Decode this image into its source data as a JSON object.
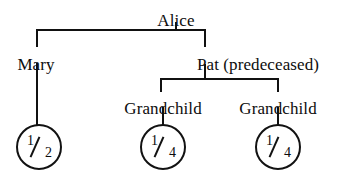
{
  "diagram": {
    "type": "family-tree-inheritance",
    "title": "",
    "background_color": "#ffffff",
    "line_color": "#111111",
    "text_color": "#0d0d0d"
  },
  "nodes": {
    "root": {
      "label": "Alice",
      "x": 176,
      "y": 12
    },
    "child_left": {
      "label": "Mary",
      "x": 36,
      "y": 56
    },
    "child_right": {
      "label": "Pat (predeceased)",
      "x": 258,
      "y": 56
    },
    "grandchild_left": {
      "label": "Grandchild",
      "x": 163,
      "y": 100
    },
    "grandchild_right": {
      "label": "Grandchild",
      "x": 278,
      "y": 100
    }
  },
  "shares": [
    {
      "name": "share-mary",
      "numerator": "1",
      "denominator": "2",
      "text": "1/2",
      "cx": 39,
      "cy": 147,
      "r": 21
    },
    {
      "name": "share-grandchild-left",
      "numerator": "1",
      "denominator": "4",
      "text": "1/4",
      "cx": 163,
      "cy": 147,
      "r": 21
    },
    {
      "name": "share-grandchild-right",
      "numerator": "1",
      "denominator": "4",
      "text": "1/4",
      "cx": 278,
      "cy": 147,
      "r": 21
    }
  ],
  "connectors": {
    "alice_stem": {
      "x": 176,
      "y_top": 22,
      "y_bottom": 30
    },
    "alice_bar": {
      "x_left": 37,
      "x_right": 206,
      "y": 29
    },
    "mary_drop_upper": {
      "x": 37,
      "y_top": 29,
      "y_bottom": 47
    },
    "mary_drop_lower": {
      "x": 37,
      "y_top": 63,
      "y_bottom": 125
    },
    "pat_drop_upper": {
      "x": 205,
      "y_top": 29,
      "y_bottom": 47
    },
    "pat_stem": {
      "x": 205,
      "y_top": 64,
      "y_bottom": 79
    },
    "pat_bar": {
      "x_left": 161,
      "x_right": 279,
      "y": 78
    },
    "grandchild_left_drop_upper": {
      "x": 161,
      "y_top": 78,
      "y_bottom": 92
    },
    "grandchild_left_drop_lower": {
      "x": 163,
      "y_top": 107,
      "y_bottom": 125
    },
    "grandchild_right_drop_upper": {
      "x": 278,
      "y_top": 78,
      "y_bottom": 92
    },
    "grandchild_right_drop_lower": {
      "x": 278,
      "y_top": 107,
      "y_bottom": 125
    }
  }
}
